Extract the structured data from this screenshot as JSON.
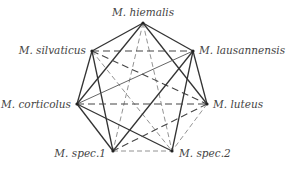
{
  "nodes": [
    {
      "id": "hiemalis",
      "label": "M. hiemalis",
      "x": 143,
      "y": 23,
      "lx": 143,
      "ly": 16,
      "anchor": "middle"
    },
    {
      "id": "silvaticus",
      "label": "M. silvaticus",
      "x": 92,
      "y": 51,
      "lx": 86,
      "ly": 54,
      "anchor": "end"
    },
    {
      "id": "lausannensis",
      "label": "M. lausannensis",
      "x": 193,
      "y": 51,
      "lx": 199,
      "ly": 54,
      "anchor": "start"
    },
    {
      "id": "corticolus",
      "label": "M. corticolus",
      "x": 77,
      "y": 104,
      "lx": 71,
      "ly": 108,
      "anchor": "end"
    },
    {
      "id": "luteus",
      "label": "M. luteus",
      "x": 207,
      "y": 104,
      "lx": 213,
      "ly": 108,
      "anchor": "start"
    },
    {
      "id": "spec1",
      "label": "M. spec.1",
      "x": 113,
      "y": 151,
      "lx": 106,
      "ly": 157,
      "anchor": "end"
    },
    {
      "id": "spec2",
      "label": "M. spec.2",
      "x": 172,
      "y": 151,
      "lx": 179,
      "ly": 157,
      "anchor": "start"
    }
  ],
  "edges": [
    {
      "from": "hiemalis",
      "to": "silvaticus",
      "style": "solid"
    },
    {
      "from": "hiemalis",
      "to": "lausannensis",
      "style": "solid"
    },
    {
      "from": "hiemalis",
      "to": "corticolus",
      "style": "solid"
    },
    {
      "from": "hiemalis",
      "to": "luteus",
      "style": "solid"
    },
    {
      "from": "hiemalis",
      "to": "spec1",
      "style": "dashed-thin"
    },
    {
      "from": "hiemalis",
      "to": "spec2",
      "style": "dashed-thin"
    },
    {
      "from": "silvaticus",
      "to": "lausannensis",
      "style": "dashed"
    },
    {
      "from": "silvaticus",
      "to": "corticolus",
      "style": "solid"
    },
    {
      "from": "silvaticus",
      "to": "luteus",
      "style": "dashed"
    },
    {
      "from": "silvaticus",
      "to": "spec1",
      "style": "solid"
    },
    {
      "from": "silvaticus",
      "to": "spec2",
      "style": "dashed-thin"
    },
    {
      "from": "lausannensis",
      "to": "corticolus",
      "style": "solid-thin"
    },
    {
      "from": "lausannensis",
      "to": "luteus",
      "style": "solid"
    },
    {
      "from": "lausannensis",
      "to": "spec1",
      "style": "solid"
    },
    {
      "from": "lausannensis",
      "to": "spec2",
      "style": "solid"
    },
    {
      "from": "corticolus",
      "to": "luteus",
      "style": "dashed"
    },
    {
      "from": "corticolus",
      "to": "spec1",
      "style": "solid"
    },
    {
      "from": "corticolus",
      "to": "spec2",
      "style": "solid"
    },
    {
      "from": "luteus",
      "to": "spec1",
      "style": "dashed"
    },
    {
      "from": "luteus",
      "to": "spec2",
      "style": "dashed-thin"
    },
    {
      "from": "spec1",
      "to": "spec2",
      "style": "dashed-thin"
    }
  ]
}
